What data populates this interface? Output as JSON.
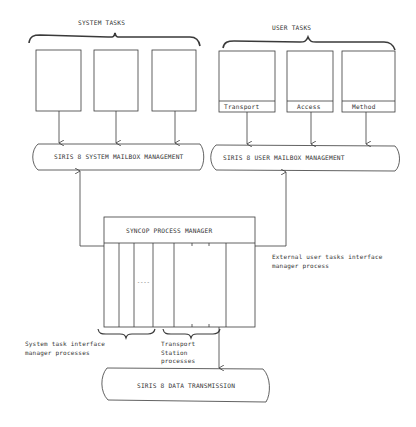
{
  "diagram": {
    "system_tasks": {
      "label": "SYSTEM TASKS",
      "boxes": [
        "",
        "",
        ""
      ]
    },
    "user_tasks": {
      "label": "USER TASKS",
      "boxes": [
        {
          "label": "Transport"
        },
        {
          "label": "Access"
        },
        {
          "label": "Method"
        }
      ]
    },
    "system_mailbox": {
      "label": "SIRIS 8 SYSTEM MAILBOX MANAGEMENT"
    },
    "user_mailbox": {
      "label": "SIRIS 8 USER MAILBOX MANAGEMENT"
    },
    "process_manager": {
      "label": "SYNCOP PROCESS MANAGER",
      "ellipsis": "----"
    },
    "annotations": {
      "external_user": "External user tasks interface\nmanager process",
      "system_task_interface": "System task interface\nmanager processes",
      "transport_station": "Transport\nStation\nprocesses"
    },
    "data_transmission": {
      "label": "SIRIS 8 DATA TRANSMISSION"
    },
    "colors": {
      "line": "#3a3a3a",
      "background": "#ffffff"
    }
  }
}
